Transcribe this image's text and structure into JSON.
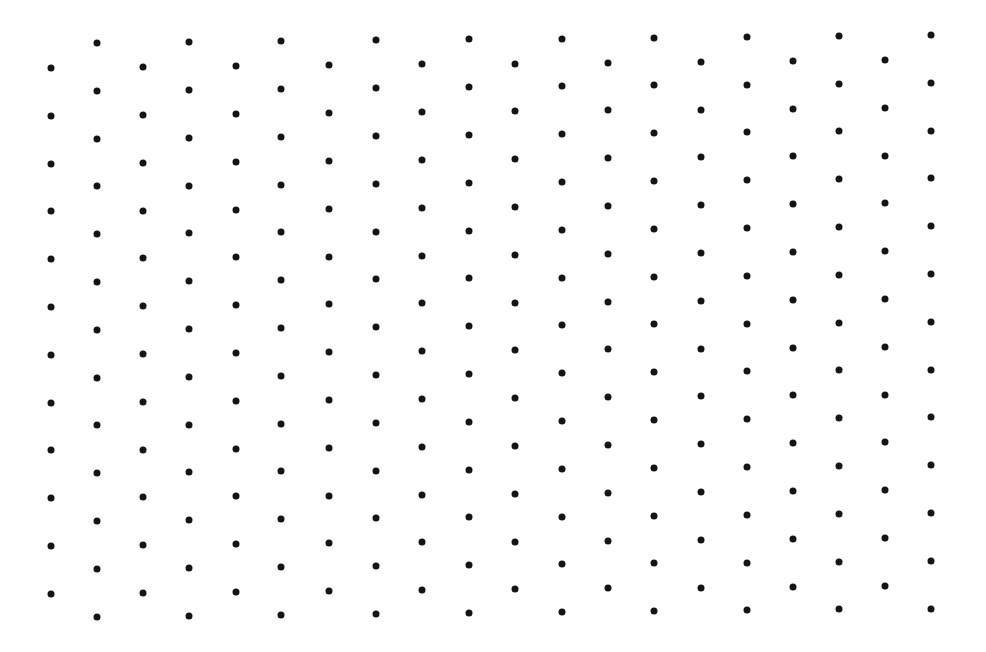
{
  "canvas": {
    "width": 986,
    "height": 652,
    "background": "#ffffff"
  },
  "dot_style": {
    "color": "#141414",
    "diameter": 7
  },
  "grid": {
    "columns_x": [
      51,
      97,
      143,
      189,
      236,
      281,
      329,
      376,
      422,
      469,
      515,
      562,
      608,
      654,
      701,
      747,
      793,
      839,
      885,
      931
    ],
    "even_column_first_y": 68,
    "odd_column_first_y": 43,
    "row_spacing": 47.8,
    "even_column_count": 12,
    "odd_column_count": 13,
    "vertical_drift_per_column": -0.45
  }
}
